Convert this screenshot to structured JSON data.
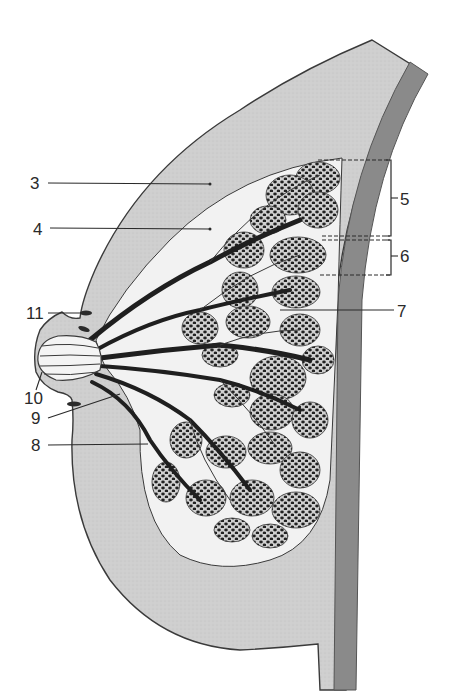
{
  "figure": {
    "colors": {
      "background": "#ffffff",
      "skin_fat": "#cfcfcf",
      "gland_stroma": "#f2f2f2",
      "chest_wall": "#8a8a8a",
      "lobule_bg": "#cacaca",
      "lobule_dots": "#222222",
      "outline": "#3a3a3a",
      "label_text": "#2a2a2a"
    },
    "labels": [
      {
        "id": "3",
        "text": "3",
        "x": 32,
        "y": 189,
        "target": [
          212,
          184
        ]
      },
      {
        "id": "4",
        "text": "4",
        "x": 35,
        "y": 234,
        "target": [
          212,
          229
        ]
      },
      {
        "id": "5",
        "text": "5",
        "x": 402,
        "y": 205,
        "target": "bracket-5"
      },
      {
        "id": "6",
        "text": "6",
        "x": 400,
        "y": 262,
        "target": "bracket-6"
      },
      {
        "id": "7",
        "text": "7",
        "x": 397,
        "y": 317,
        "target": [
          280,
          310
        ]
      },
      {
        "id": "8",
        "text": "8",
        "x": 33,
        "y": 451,
        "target": [
          148,
          443
        ]
      },
      {
        "id": "9",
        "text": "9",
        "x": 33,
        "y": 424,
        "target": [
          120,
          395
        ]
      },
      {
        "id": "10",
        "text": "10",
        "x": 26,
        "y": 404,
        "target": [
          40,
          370
        ]
      },
      {
        "id": "11",
        "text": "11",
        "x": 27,
        "y": 319,
        "target": [
          82,
          313
        ]
      }
    ]
  }
}
